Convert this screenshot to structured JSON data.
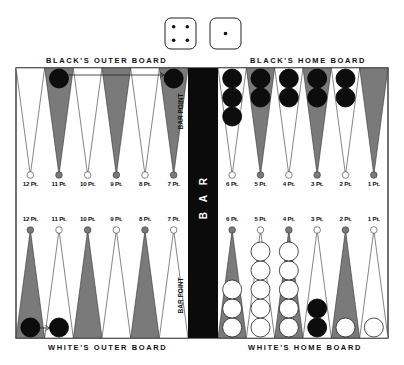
{
  "dice": [
    {
      "value": 4,
      "name": "die-four"
    },
    {
      "value": 1,
      "name": "die-one"
    }
  ],
  "titles": {
    "black_outer": "BLACK'S OUTER BOARD",
    "black_home": "BLACK'S HOME BOARD",
    "white_outer": "WHITE'S OUTER BOARD",
    "white_home": "WHITE'S HOME BOARD"
  },
  "bar": {
    "letters": [
      "B",
      "A",
      "R"
    ],
    "bar_point_label": "BAR POINT"
  },
  "colors": {
    "dark_point": "#7a7a7a",
    "light_point": "#ffffff",
    "bar": "#0b0b0b",
    "black_checker": "#0d0d0d",
    "white_checker": "#ffffff",
    "outline": "#333333"
  },
  "top_row": {
    "labels": [
      "12 Pt.",
      "11 Pt.",
      "10 Pt.",
      "9 Pt.",
      "8 Pt.",
      "7 Pt.",
      "6 Pt.",
      "5 Pt.",
      "4 Pt.",
      "3 Pt.",
      "2 Pt.",
      "1 Pt."
    ],
    "shades": [
      "light",
      "dark",
      "light",
      "dark",
      "light",
      "dark",
      "light",
      "dark",
      "light",
      "dark",
      "light",
      "dark"
    ],
    "checkers": [
      {
        "color": "none",
        "count": 0
      },
      {
        "color": "black",
        "count": 1
      },
      {
        "color": "none",
        "count": 0
      },
      {
        "color": "none",
        "count": 0
      },
      {
        "color": "none",
        "count": 0
      },
      {
        "color": "black",
        "count": 1
      },
      {
        "color": "black",
        "count": 3
      },
      {
        "color": "black",
        "count": 2
      },
      {
        "color": "black",
        "count": 2
      },
      {
        "color": "black",
        "count": 2
      },
      {
        "color": "black",
        "count": 2
      },
      {
        "color": "none",
        "count": 0
      }
    ]
  },
  "bottom_row": {
    "labels": [
      "12 Pt.",
      "11 Pt.",
      "10 Pt.",
      "9 Pt.",
      "8 Pt.",
      "7 Pt.",
      "6 Pt.",
      "5 Pt.",
      "4 Pt.",
      "3 Pt.",
      "2 Pt.",
      "1 Pt."
    ],
    "shades": [
      "dark",
      "light",
      "dark",
      "light",
      "dark",
      "light",
      "dark",
      "light",
      "dark",
      "light",
      "dark",
      "light"
    ],
    "checkers": [
      {
        "color": "black",
        "count": 1
      },
      {
        "color": "black",
        "count": 1
      },
      {
        "color": "none",
        "count": 0
      },
      {
        "color": "none",
        "count": 0
      },
      {
        "color": "none",
        "count": 0
      },
      {
        "color": "none",
        "count": 0
      },
      {
        "color": "white",
        "count": 3
      },
      {
        "color": "white",
        "count": 5
      },
      {
        "color": "white",
        "count": 5
      },
      {
        "color": "black",
        "count": 2
      },
      {
        "color": "white",
        "count": 1
      },
      {
        "color": "white",
        "count": 1
      }
    ]
  },
  "arrows": [
    {
      "from_row": "top",
      "from_point": "11 Pt.",
      "to_point": "7 Pt."
    },
    {
      "from_row": "bottom",
      "from_point": "12 Pt.",
      "to_point": "11 Pt."
    }
  ]
}
